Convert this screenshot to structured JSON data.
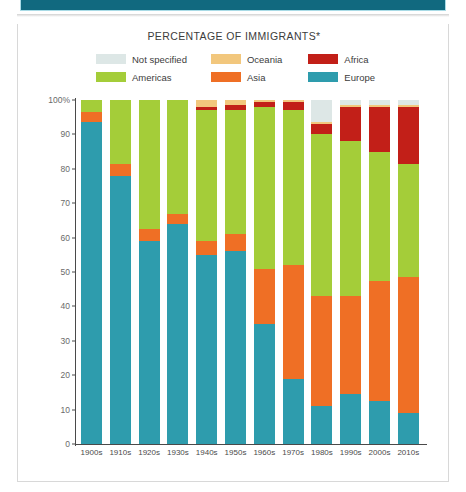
{
  "header": {
    "band_color": "#11697f"
  },
  "chart": {
    "title": "PERCENTAGE OF IMMIGRANTS*"
  },
  "legend": {
    "rows": [
      [
        {
          "label": "Not specified",
          "color": "#dde7e6",
          "key": "not_specified"
        },
        {
          "label": "Oceania",
          "color": "#f2c77d",
          "key": "oceania"
        },
        {
          "label": "Africa",
          "color": "#c21f18",
          "key": "africa"
        }
      ],
      [
        {
          "label": "Americas",
          "color": "#a4cd39",
          "key": "americas"
        },
        {
          "label": "Asia",
          "color": "#ef6f25",
          "key": "asia"
        },
        {
          "label": "Europe",
          "color": "#2e9cad",
          "key": "europe"
        }
      ]
    ]
  },
  "chart_data": {
    "type": "bar",
    "subtype": "stacked-100-percent",
    "title": "PERCENTAGE OF IMMIGRANTS*",
    "xlabel": "",
    "ylabel": "",
    "ylim": [
      0,
      100
    ],
    "yticks": [
      "0",
      "10",
      "20",
      "30",
      "40",
      "50",
      "60",
      "70",
      "80",
      "90",
      "100%"
    ],
    "ytick_values": [
      0,
      10,
      20,
      30,
      40,
      50,
      60,
      70,
      80,
      90,
      100
    ],
    "grid": false,
    "legend_position": "top",
    "categories": [
      "1900s",
      "1910s",
      "1920s",
      "1930s",
      "1940s",
      "1950s",
      "1960s",
      "1970s",
      "1980s",
      "1990s",
      "2000s",
      "2010s"
    ],
    "series": [
      {
        "name": "Europe",
        "color": "#2e9cad",
        "values": [
          93.5,
          78.0,
          59.0,
          64.0,
          55.0,
          56.0,
          35.0,
          19.0,
          11.0,
          14.5,
          12.5,
          9.0
        ]
      },
      {
        "name": "Asia",
        "color": "#ef6f25",
        "values": [
          3.0,
          3.5,
          3.5,
          3.0,
          4.0,
          5.0,
          16.0,
          33.0,
          32.0,
          28.5,
          35.0,
          39.5
        ]
      },
      {
        "name": "Americas",
        "color": "#a4cd39",
        "values": [
          3.5,
          18.5,
          37.5,
          33.0,
          38.0,
          36.0,
          47.0,
          45.0,
          47.0,
          45.0,
          37.5,
          33.0
        ]
      },
      {
        "name": "Africa",
        "color": "#c21f18",
        "values": [
          0.0,
          0.0,
          0.0,
          0.0,
          1.0,
          1.5,
          1.5,
          2.5,
          3.0,
          10.0,
          13.0,
          16.5
        ]
      },
      {
        "name": "Oceania",
        "color": "#f2c77d",
        "values": [
          0.0,
          0.0,
          0.0,
          0.0,
          2.0,
          1.5,
          0.5,
          0.5,
          0.5,
          0.5,
          0.5,
          0.5
        ]
      },
      {
        "name": "Not specified",
        "color": "#dde7e6",
        "values": [
          0.0,
          0.0,
          0.0,
          0.0,
          0.0,
          0.0,
          0.0,
          0.0,
          6.5,
          1.5,
          1.5,
          1.5
        ]
      }
    ]
  }
}
